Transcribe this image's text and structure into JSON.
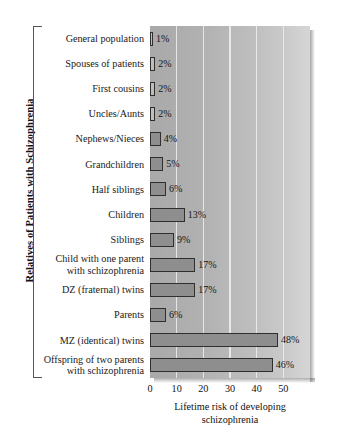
{
  "chart_data": {
    "type": "bar",
    "orientation": "horizontal",
    "title": "",
    "ylabel": "Relatives of Patients with Schizophrenia",
    "xlabel": "Lifetime risk of developing schizophrenia",
    "xlabel_lines": [
      "Lifetime risk of developing",
      "schizophrenia"
    ],
    "xlim": [
      0,
      60
    ],
    "xticks": [
      0,
      10,
      20,
      30,
      40,
      50
    ],
    "xtick_labels": [
      "0",
      "10",
      "20",
      "30",
      "40",
      "50"
    ],
    "grid": true,
    "grid_axis": "x",
    "legend": null,
    "value_suffix": "%",
    "categories": [
      "General population",
      "Spouses of patients",
      "First cousins",
      "Uncles/Aunts",
      "Nephews/Nieces",
      "Grandchildren",
      "Half siblings",
      "Children",
      "Siblings",
      "Child with one parent with schizophrenia",
      "DZ (fraternal) twins",
      "Parents",
      "MZ (identical) twins",
      "Offspring of two parents with schizophrenia"
    ],
    "category_lines": [
      [
        "General population"
      ],
      [
        "Spouses of patients"
      ],
      [
        "First cousins"
      ],
      [
        "Uncles/Aunts"
      ],
      [
        "Nephews/Nieces"
      ],
      [
        "Grandchildren"
      ],
      [
        "Half siblings"
      ],
      [
        "Children"
      ],
      [
        "Siblings"
      ],
      [
        "Child with one parent",
        "with schizophrenia"
      ],
      [
        "DZ (fraternal) twins"
      ],
      [
        "Parents"
      ],
      [
        "MZ (identical) twins"
      ],
      [
        "Offspring of two parents",
        "with schizophrenia"
      ]
    ],
    "values": [
      1,
      2,
      2,
      2,
      4,
      5,
      6,
      13,
      9,
      17,
      17,
      6,
      48,
      46
    ],
    "value_labels": [
      "1%",
      "2%",
      "2%",
      "2%",
      "4%",
      "5%",
      "6%",
      "13%",
      "9%",
      "17%",
      "17%",
      "6%",
      "48%",
      "46%"
    ]
  },
  "colors": {
    "bar_fill": "#8e8e8e",
    "bar_edge": "#2f2f2f",
    "plot_background": "#b4b4b4",
    "gridline": "#f0f0f0",
    "text": "#111111",
    "page_background": "#ffffff"
  }
}
